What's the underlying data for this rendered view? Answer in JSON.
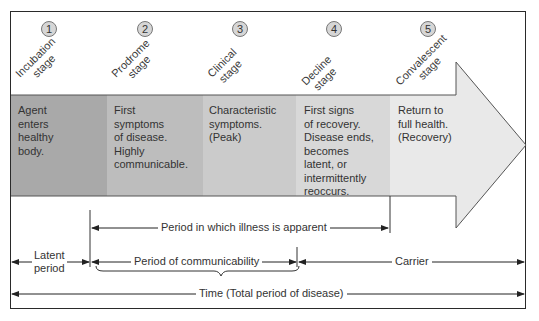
{
  "stages": [
    {
      "number": "1",
      "name_line1": "Incubation",
      "name_line2": "stage",
      "description": [
        "Agent",
        "enters",
        "healthy",
        "body."
      ],
      "color": "#a9a9a9"
    },
    {
      "number": "2",
      "name_line1": "Prodrome",
      "name_line2": "stage",
      "description": [
        "First",
        "symptoms",
        "of disease.",
        "Highly",
        "communicable."
      ],
      "color": "#bdbdbd"
    },
    {
      "number": "3",
      "name_line1": "Clinical",
      "name_line2": "stage",
      "description": [
        "Characteristic",
        "symptoms.",
        "(Peak)"
      ],
      "color": "#cbcbcb"
    },
    {
      "number": "4",
      "name_line1": "Decline",
      "name_line2": "stage",
      "description": [
        "First signs",
        "of recovery.",
        "Disease ends,",
        "becomes",
        "latent, or",
        "intermittently",
        "reoccurs."
      ],
      "color": "#d8d8d8"
    },
    {
      "number": "5",
      "name_line1": "Convalescent",
      "name_line2": "stage",
      "description": [
        "Return to",
        "full health.",
        "(Recovery)"
      ],
      "color": "#e9e9e9"
    }
  ],
  "periods": {
    "illness_apparent": "Period in which illness is apparent",
    "latent_line1": "Latent",
    "latent_line2": "period",
    "communicability": "Period of communicability",
    "carrier": "Carrier",
    "total": "Time (Total period of disease)"
  }
}
